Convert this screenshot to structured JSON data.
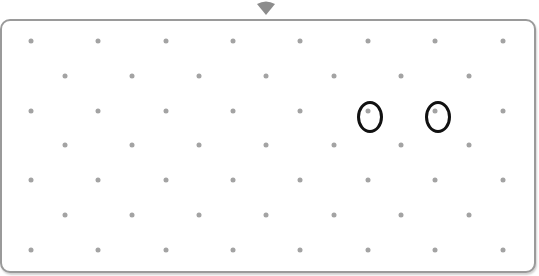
{
  "board": {
    "label": "Dot grid board",
    "pointer_color": "#8c8c8c",
    "border_color": "#9a9a9a",
    "dot_color": "#a3a3a3",
    "ring_color": "#111111",
    "rows_y": [
      41,
      75.5,
      110.5,
      145,
      180,
      215,
      250
    ],
    "even_row_x": [
      31,
      98,
      165.5,
      232.5,
      300,
      367.5,
      435,
      502.5
    ],
    "odd_row_x": [
      64.5,
      131.5,
      199,
      266,
      333.5,
      401,
      468.5
    ],
    "marked_points": [
      {
        "row": 2,
        "col": 5,
        "x": 370,
        "y": 117
      },
      {
        "row": 2,
        "col": 6,
        "x": 438,
        "y": 117
      }
    ]
  }
}
